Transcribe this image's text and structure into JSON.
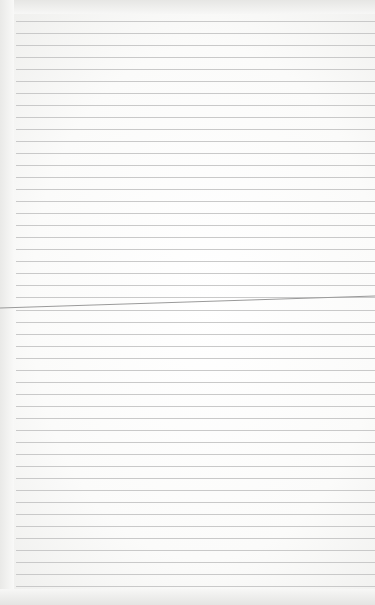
{
  "image": {
    "subject": "blank lined notebook paper",
    "rule_count": 48,
    "has_fold_crease": true,
    "colors": {
      "paper": "#fbfbfa",
      "rule": "#c9c9c9",
      "crease": "#9a9a9a"
    }
  }
}
